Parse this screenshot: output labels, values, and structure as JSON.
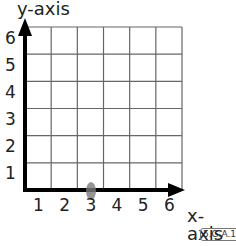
{
  "diagram": {
    "type": "coordinate-grid",
    "x_axis_label": "x-axis",
    "y_axis_label": "y-axis",
    "x_ticks": [
      "1",
      "2",
      "3",
      "4",
      "5",
      "6"
    ],
    "y_ticks": [
      "1",
      "2",
      "3",
      "4",
      "5",
      "6"
    ],
    "grid_size": [
      6,
      6
    ],
    "standard_code": "5.G.A.1",
    "mark": {
      "x": 3,
      "y": 0,
      "description": "gray smudge mark at x=3 on x-axis"
    }
  },
  "colors": {
    "grid_line": "#666666",
    "axis": "#000000",
    "text": "#222222",
    "mark": "#7a7a7a"
  }
}
